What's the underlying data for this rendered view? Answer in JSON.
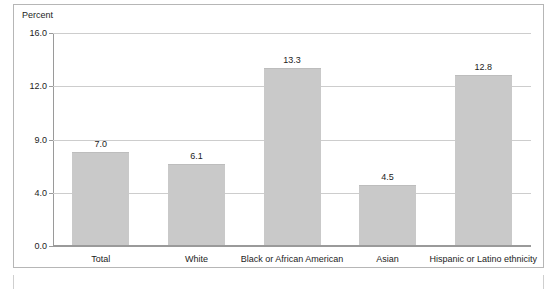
{
  "chart_data": {
    "type": "bar",
    "title": "",
    "ylabel": "Percent",
    "xlabel": "",
    "categories": [
      "Total",
      "White",
      "Black or African American",
      "Asian",
      "Hispanic or Latino ethnicity"
    ],
    "values": [
      7.0,
      6.1,
      13.3,
      4.5,
      12.8
    ],
    "value_labels": [
      "7.0",
      "6.1",
      "13.3",
      "4.5",
      "12.8"
    ],
    "ytick_labels": [
      "16.0",
      "12.0",
      "9.0",
      "4.0",
      "0.0"
    ],
    "ytick_values": [
      16.0,
      12.0,
      9.0,
      4.0,
      0.0
    ],
    "ylim": [
      0,
      16
    ],
    "grid": true,
    "legend": "none",
    "bar_color": "#c9c9c9",
    "gridline_color": "#cdcdcd",
    "axis_color": "#9a9a9a",
    "text_color": "#1c1c1c"
  }
}
